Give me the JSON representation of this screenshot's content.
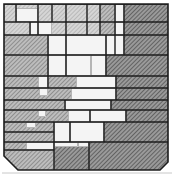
{
  "artwork": {
    "title": "",
    "style": "pencil-hatched abstract grid",
    "colors": {
      "background": "#ffffff",
      "paper": "#f4f4f4",
      "hatch_light": "#b8b8b8",
      "hatch_mid": "#8e8e8e",
      "hatch_dark": "#6a6a6a",
      "line": "#1c1c1c"
    },
    "frame": {
      "left": 4,
      "top": 4,
      "right": 168,
      "bottom": 170,
      "chamfer_bl": 14,
      "chamfer_br": 8
    },
    "cells": [
      {
        "x": 4,
        "y": 4,
        "w": 12,
        "h": 18,
        "tone": "light"
      },
      {
        "x": 16,
        "y": 4,
        "w": 22,
        "h": 8,
        "tone": "light"
      },
      {
        "x": 16,
        "y": 8,
        "w": 22,
        "h": 14,
        "tone": "white"
      },
      {
        "x": 38,
        "y": 4,
        "w": 14,
        "h": 18,
        "tone": "light"
      },
      {
        "x": 52,
        "y": 4,
        "w": 14,
        "h": 31,
        "tone": "light"
      },
      {
        "x": 66,
        "y": 4,
        "w": 21,
        "h": 31,
        "tone": "light"
      },
      {
        "x": 87,
        "y": 4,
        "w": 13,
        "h": 31,
        "tone": "light"
      },
      {
        "x": 100,
        "y": 4,
        "w": 15,
        "h": 31,
        "tone": "mid"
      },
      {
        "x": 115,
        "y": 4,
        "w": 9,
        "h": 18,
        "tone": "white"
      },
      {
        "x": 124,
        "y": 4,
        "w": 44,
        "h": 18,
        "tone": "dark"
      },
      {
        "x": 4,
        "y": 22,
        "w": 26,
        "h": 13,
        "tone": "light"
      },
      {
        "x": 30,
        "y": 22,
        "w": 8,
        "h": 13,
        "tone": "white"
      },
      {
        "x": 38,
        "y": 22,
        "w": 14,
        "h": 13,
        "tone": "white"
      },
      {
        "x": 115,
        "y": 22,
        "w": 9,
        "h": 13,
        "tone": "white"
      },
      {
        "x": 124,
        "y": 22,
        "w": 44,
        "h": 13,
        "tone": "dark"
      },
      {
        "x": 4,
        "y": 35,
        "w": 44,
        "h": 20,
        "tone": "mid"
      },
      {
        "x": 48,
        "y": 35,
        "w": 18,
        "h": 20,
        "tone": "white"
      },
      {
        "x": 66,
        "y": 35,
        "w": 40,
        "h": 20,
        "tone": "white"
      },
      {
        "x": 106,
        "y": 35,
        "w": 18,
        "h": 20,
        "tone": "white"
      },
      {
        "x": 124,
        "y": 35,
        "w": 44,
        "h": 20,
        "tone": "dark"
      },
      {
        "x": 4,
        "y": 55,
        "w": 44,
        "h": 21,
        "tone": "mid"
      },
      {
        "x": 48,
        "y": 55,
        "w": 18,
        "h": 21,
        "tone": "white"
      },
      {
        "x": 66,
        "y": 55,
        "w": 25,
        "h": 21,
        "tone": "white"
      },
      {
        "x": 91,
        "y": 55,
        "w": 15,
        "h": 21,
        "tone": "white"
      },
      {
        "x": 106,
        "y": 55,
        "w": 62,
        "h": 21,
        "tone": "dark"
      },
      {
        "x": 4,
        "y": 76,
        "w": 34,
        "h": 12,
        "tone": "mid"
      },
      {
        "x": 38,
        "y": 76,
        "w": 10,
        "h": 12,
        "tone": "white"
      },
      {
        "x": 48,
        "y": 76,
        "w": 28,
        "h": 12,
        "tone": "mid"
      },
      {
        "x": 76,
        "y": 76,
        "w": 40,
        "h": 12,
        "tone": "white"
      },
      {
        "x": 116,
        "y": 76,
        "w": 52,
        "h": 12,
        "tone": "dark"
      },
      {
        "x": 4,
        "y": 88,
        "w": 35,
        "h": 12,
        "tone": "mid"
      },
      {
        "x": 39,
        "y": 88,
        "w": 9,
        "h": 8,
        "tone": "white"
      },
      {
        "x": 39,
        "y": 96,
        "w": 9,
        "h": 4,
        "tone": "mid"
      },
      {
        "x": 48,
        "y": 88,
        "w": 23,
        "h": 12,
        "tone": "mid"
      },
      {
        "x": 71,
        "y": 88,
        "w": 45,
        "h": 12,
        "tone": "white"
      },
      {
        "x": 116,
        "y": 88,
        "w": 52,
        "h": 12,
        "tone": "dark"
      },
      {
        "x": 4,
        "y": 100,
        "w": 61,
        "h": 10,
        "tone": "mid"
      },
      {
        "x": 65,
        "y": 100,
        "w": 46,
        "h": 10,
        "tone": "white"
      },
      {
        "x": 111,
        "y": 100,
        "w": 57,
        "h": 10,
        "tone": "dark"
      },
      {
        "x": 4,
        "y": 110,
        "w": 34,
        "h": 12,
        "tone": "mid"
      },
      {
        "x": 38,
        "y": 110,
        "w": 8,
        "h": 7,
        "tone": "white"
      },
      {
        "x": 46,
        "y": 110,
        "w": 22,
        "h": 12,
        "tone": "mid"
      },
      {
        "x": 68,
        "y": 110,
        "w": 22,
        "h": 12,
        "tone": "white"
      },
      {
        "x": 90,
        "y": 110,
        "w": 36,
        "h": 12,
        "tone": "white"
      },
      {
        "x": 126,
        "y": 110,
        "w": 42,
        "h": 12,
        "tone": "dark"
      },
      {
        "x": 4,
        "y": 122,
        "w": 22,
        "h": 10,
        "tone": "mid"
      },
      {
        "x": 26,
        "y": 122,
        "w": 10,
        "h": 6,
        "tone": "white"
      },
      {
        "x": 36,
        "y": 122,
        "w": 18,
        "h": 10,
        "tone": "mid"
      },
      {
        "x": 54,
        "y": 122,
        "w": 16,
        "h": 20,
        "tone": "white"
      },
      {
        "x": 70,
        "y": 122,
        "w": 34,
        "h": 20,
        "tone": "white"
      },
      {
        "x": 104,
        "y": 122,
        "w": 64,
        "h": 20,
        "tone": "dark"
      },
      {
        "x": 4,
        "y": 132,
        "w": 50,
        "h": 10,
        "tone": "mid"
      },
      {
        "x": 4,
        "y": 142,
        "w": 22,
        "h": 8,
        "tone": "mid"
      },
      {
        "x": 26,
        "y": 142,
        "w": 28,
        "h": 8,
        "tone": "white"
      },
      {
        "x": 54,
        "y": 142,
        "w": 24,
        "h": 5,
        "tone": "white"
      },
      {
        "x": 78,
        "y": 142,
        "w": 11,
        "h": 5,
        "tone": "white"
      },
      {
        "x": 54,
        "y": 147,
        "w": 35,
        "h": 23,
        "tone": "dark"
      },
      {
        "x": 89,
        "y": 142,
        "w": 79,
        "h": 28,
        "tone": "dark"
      },
      {
        "x": 4,
        "y": 150,
        "w": 50,
        "h": 20,
        "tone": "mid"
      }
    ],
    "h_lines": [
      {
        "x1": 4,
        "x2": 168,
        "y": 4
      },
      {
        "x1": 4,
        "x2": 124,
        "y": 22
      },
      {
        "x1": 124,
        "x2": 168,
        "y": 22
      },
      {
        "x1": 4,
        "x2": 168,
        "y": 35
      },
      {
        "x1": 4,
        "x2": 168,
        "y": 55
      },
      {
        "x1": 4,
        "x2": 168,
        "y": 76
      },
      {
        "x1": 4,
        "x2": 168,
        "y": 88
      },
      {
        "x1": 4,
        "x2": 168,
        "y": 100
      },
      {
        "x1": 4,
        "x2": 168,
        "y": 110
      },
      {
        "x1": 4,
        "x2": 168,
        "y": 122
      },
      {
        "x1": 4,
        "x2": 54,
        "y": 132
      },
      {
        "x1": 4,
        "x2": 168,
        "y": 142
      },
      {
        "x1": 4,
        "x2": 54,
        "y": 150
      }
    ],
    "v_lines": [
      {
        "x": 16,
        "y1": 4,
        "y2": 22
      },
      {
        "x": 38,
        "y1": 4,
        "y2": 35
      },
      {
        "x": 52,
        "y1": 4,
        "y2": 22
      },
      {
        "x": 66,
        "y1": 4,
        "y2": 76
      },
      {
        "x": 87,
        "y1": 4,
        "y2": 35
      },
      {
        "x": 100,
        "y1": 4,
        "y2": 35
      },
      {
        "x": 115,
        "y1": 4,
        "y2": 55
      },
      {
        "x": 124,
        "y1": 4,
        "y2": 55
      },
      {
        "x": 30,
        "y1": 22,
        "y2": 35
      },
      {
        "x": 106,
        "y1": 35,
        "y2": 76
      },
      {
        "x": 48,
        "y1": 35,
        "y2": 88
      },
      {
        "x": 116,
        "y1": 76,
        "y2": 100
      },
      {
        "x": 111,
        "y1": 100,
        "y2": 110
      },
      {
        "x": 126,
        "y1": 110,
        "y2": 122
      },
      {
        "x": 65,
        "y1": 100,
        "y2": 110
      },
      {
        "x": 90,
        "y1": 110,
        "y2": 122
      },
      {
        "x": 104,
        "y1": 122,
        "y2": 142
      },
      {
        "x": 54,
        "y1": 122,
        "y2": 170
      },
      {
        "x": 70,
        "y1": 122,
        "y2": 142
      },
      {
        "x": 89,
        "y1": 142,
        "y2": 170
      }
    ]
  }
}
